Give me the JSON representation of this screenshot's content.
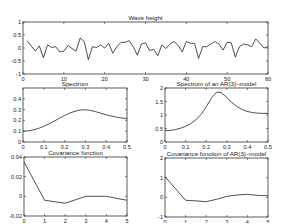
{
  "figure": {
    "background": "#ffffff",
    "line_color": "#222222",
    "axis_color": "#333333"
  },
  "chart_data": [
    {
      "id": "wave",
      "type": "line",
      "title": "Wave height",
      "xlabel": "",
      "ylabel": "",
      "box": {
        "x0": 23,
        "y0": 22,
        "x1": 268,
        "y1": 74
      },
      "xlim": [
        0,
        60
      ],
      "ylim": [
        -1,
        1
      ],
      "xticks": [
        0,
        10,
        20,
        30,
        40,
        50,
        60
      ],
      "yticks": [
        -1,
        -0.5,
        0,
        0.5,
        1
      ],
      "ytick_labels": [
        "-1",
        "-0.5",
        "0",
        "0.5",
        "1"
      ],
      "x": [
        1,
        2,
        3,
        4,
        5,
        6,
        7,
        8,
        9,
        10,
        11,
        12,
        13,
        14,
        15,
        16,
        17,
        18,
        19,
        20,
        21,
        22,
        23,
        24,
        25,
        26,
        27,
        28,
        29,
        30,
        31,
        32,
        33,
        34,
        35,
        36,
        37,
        38,
        39,
        40,
        41,
        42,
        43,
        44,
        45,
        46,
        47,
        48,
        49,
        50,
        51,
        52,
        53,
        54,
        55,
        56,
        57,
        58,
        59,
        60
      ],
      "y": [
        0.28,
        0.08,
        -0.12,
        0.08,
        -0.38,
        0.12,
        0.02,
        0.05,
        -0.15,
        -0.12,
        0.1,
        -0.02,
        -0.12,
        0.38,
        0.25,
        -0.45,
        0.05,
        0.02,
        0.12,
        0.0,
        0.18,
        -0.2,
        0.05,
        0.22,
        0.22,
        0.28,
        0.05,
        -0.28,
        0.15,
        0.2,
        -0.1,
        -0.05,
        -0.3,
        0.12,
        -0.02,
        0.15,
        0.25,
        0.1,
        -0.15,
        0.25,
        0.18,
        0.18,
        -0.4,
        0.05,
        0.05,
        0.15,
        0.25,
        0.15,
        -0.08,
        0.22,
        0.2,
        -0.35,
        0.05,
        0.15,
        0.12,
        0.05,
        0.35,
        0.18,
        0.0,
        0.05
      ]
    },
    {
      "id": "spectrum",
      "type": "line",
      "title": "Spectrum",
      "xlabel": "",
      "ylabel": "",
      "box": {
        "x0": 23,
        "y0": 88,
        "x1": 127,
        "y1": 142
      },
      "xlim": [
        0,
        0.5
      ],
      "ylim": [
        0,
        0.5
      ],
      "xticks": [
        0,
        0.1,
        0.2,
        0.3,
        0.4,
        0.5
      ],
      "xtick_labels": [
        "0",
        "0.1",
        "0.2",
        "0.3",
        "0.4",
        "0.5"
      ],
      "yticks": [
        0,
        0.1,
        0.2,
        0.3,
        0.4
      ],
      "ytick_labels": [
        "0",
        "0.1",
        "0.2",
        "0.3",
        "0.4"
      ],
      "x": [
        0,
        0.025,
        0.05,
        0.075,
        0.1,
        0.125,
        0.15,
        0.175,
        0.2,
        0.225,
        0.25,
        0.275,
        0.3,
        0.325,
        0.35,
        0.375,
        0.4,
        0.425,
        0.45,
        0.475,
        0.5
      ],
      "y": [
        0.1,
        0.103,
        0.112,
        0.126,
        0.145,
        0.168,
        0.194,
        0.22,
        0.245,
        0.268,
        0.285,
        0.296,
        0.298,
        0.292,
        0.28,
        0.266,
        0.252,
        0.24,
        0.23,
        0.222,
        0.218
      ]
    },
    {
      "id": "ar3-spectrum",
      "type": "line",
      "title": "Spectrum of an AR(3)–model",
      "xlabel": "",
      "ylabel": "",
      "box": {
        "x0": 165,
        "y0": 88,
        "x1": 268,
        "y1": 142
      },
      "xlim": [
        0,
        0.5
      ],
      "ylim": [
        0,
        2
      ],
      "xticks": [
        0,
        0.1,
        0.2,
        0.3,
        0.4,
        0.5
      ],
      "xtick_labels": [
        "0",
        "0.1",
        "0.2",
        "0.3",
        "0.4",
        "0.5"
      ],
      "yticks": [
        0,
        0.5,
        1,
        1.5,
        2
      ],
      "ytick_labels": [
        "0",
        "0.5",
        "1",
        "1.5",
        "2"
      ],
      "x": [
        0,
        0.025,
        0.05,
        0.075,
        0.1,
        0.125,
        0.15,
        0.175,
        0.2,
        0.225,
        0.25,
        0.275,
        0.3,
        0.325,
        0.35,
        0.375,
        0.4,
        0.425,
        0.45,
        0.475,
        0.5
      ],
      "y": [
        0.42,
        0.43,
        0.46,
        0.51,
        0.58,
        0.68,
        0.82,
        1.02,
        1.3,
        1.62,
        1.85,
        1.82,
        1.65,
        1.46,
        1.31,
        1.2,
        1.13,
        1.09,
        1.07,
        1.06,
        1.06
      ]
    },
    {
      "id": "covariance",
      "type": "line",
      "title": "Covariance function",
      "xlabel": "",
      "ylabel": "",
      "box": {
        "x0": 24,
        "y0": 157,
        "x1": 127,
        "y1": 216
      },
      "xlim": [
        0,
        5
      ],
      "ylim": [
        -0.02,
        0.04
      ],
      "xticks": [
        0,
        1,
        2,
        3,
        4,
        5
      ],
      "xtick_labels": [
        "0",
        "1",
        "2",
        "3",
        "4",
        "5"
      ],
      "yticks": [
        -0.02,
        0,
        0.02,
        0.04
      ],
      "ytick_labels": [
        "-0.02",
        "0",
        "0.02",
        "0.04"
      ],
      "x": [
        0,
        1,
        2,
        3,
        4,
        5
      ],
      "y": [
        0.035,
        -0.004,
        -0.007,
        0.0,
        0.0,
        -0.004
      ]
    },
    {
      "id": "ar3-covariance",
      "type": "line",
      "title": "Covariance function of AR(3)–model",
      "xlabel": "",
      "ylabel": "",
      "box": {
        "x0": 165,
        "y0": 158,
        "x1": 268,
        "y1": 217
      },
      "xlim": [
        0,
        5
      ],
      "ylim": [
        -1,
        2
      ],
      "xticks": [
        0,
        1,
        2,
        3,
        4,
        5
      ],
      "xtick_labels": [
        "0",
        "1",
        "2",
        "3",
        "4",
        "5"
      ],
      "yticks": [
        -1,
        0,
        1,
        2
      ],
      "ytick_labels": [
        "-1",
        "0",
        "1",
        "2"
      ],
      "x": [
        0,
        0.5,
        1,
        1.5,
        2,
        2.5,
        3,
        3.5,
        4,
        4.5,
        5
      ],
      "y": [
        1.05,
        0.45,
        -0.15,
        -0.18,
        -0.22,
        -0.1,
        0.05,
        0.12,
        0.15,
        0.1,
        0.08
      ]
    }
  ]
}
